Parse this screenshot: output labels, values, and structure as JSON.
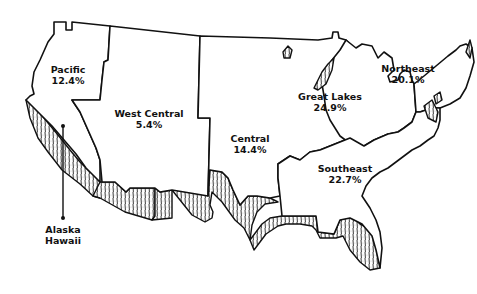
{
  "map": {
    "title": "",
    "shading_legend": "hatched coastal band",
    "colors": {
      "outline": "#111111",
      "background": "#ffffff"
    },
    "regions": [
      {
        "name": "Pacific",
        "value": "12.4%"
      },
      {
        "name": "West Central",
        "value": "5.4%"
      },
      {
        "name": "Central",
        "value": "14.4%"
      },
      {
        "name": "Great Lakes",
        "value": "24.9%"
      },
      {
        "name": "Northeast",
        "value": "20.1%"
      },
      {
        "name": "Southeast",
        "value": "22.7%"
      }
    ],
    "callout": {
      "line1": "Alaska",
      "line2": "Hawaii"
    }
  }
}
